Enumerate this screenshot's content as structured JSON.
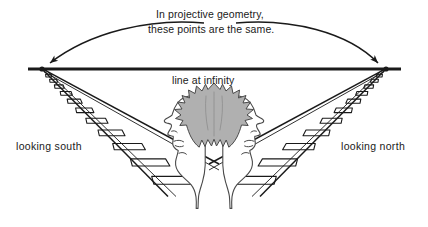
{
  "figure": {
    "background_color": "#ffffff",
    "ink_color": "#1a1a1a",
    "hair_fill_color": "#b0b0b0",
    "width": 428,
    "height": 227
  },
  "annotations": {
    "caption_line1": "In projective geometry,",
    "caption_line2": "these points are the same.",
    "horizon_label": "line at infinity",
    "label_left": "looking south",
    "label_right": "looking north"
  },
  "geometry": {
    "vanishing_point_left": {
      "x": 42,
      "y": 69
    },
    "vanishing_point_right": {
      "x": 386,
      "y": 69
    },
    "horizon_line": {
      "x1": 28,
      "y1": 69,
      "x2": 401,
      "y2": 69
    },
    "arc_left_label": "curved-arrow-to-left-vanishing-point",
    "arc_right_label": "curved-arrow-to-right-vanishing-point"
  },
  "icons": {
    "arrowhead": "arrowhead-icon",
    "railroad_left": "railroad-track-left-icon",
    "railroad_right": "railroad-track-right-icon",
    "face_left": "face-profile-left-icon",
    "face_right": "face-profile-right-icon",
    "hair": "hair-icon"
  }
}
